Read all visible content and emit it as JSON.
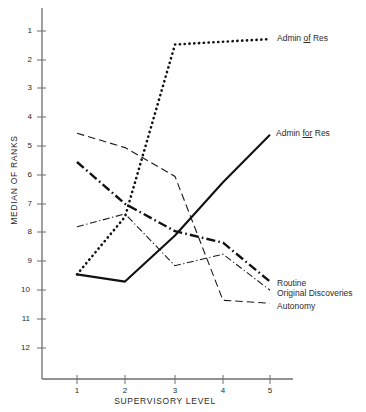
{
  "chart_data": {
    "type": "line",
    "title": "",
    "xlabel": "SUPERVISORY LEVEL",
    "ylabel": "MEDIAN OF RANKS",
    "x": [
      1,
      2,
      3,
      4,
      5
    ],
    "xticklabels": [
      "1",
      "2",
      "3",
      "4",
      "5"
    ],
    "yticklabels": [
      "1",
      "2",
      "3",
      "4",
      "5",
      "6",
      "7",
      "8",
      "9",
      "10",
      "11",
      "12"
    ],
    "yticks": [
      1,
      2,
      3,
      4,
      5,
      6,
      7,
      8,
      9,
      10,
      11,
      12
    ],
    "ylim": [
      12.5,
      0.5
    ],
    "y_inverted": true,
    "grid": false,
    "legend": "inline-right-labels",
    "series": [
      {
        "name": "Admin of Res",
        "label_html": "Admin <u>of</u> Res",
        "style": "dotted",
        "values": [
          9.45,
          7.45,
          1.47,
          1.37,
          1.28
        ]
      },
      {
        "name": "Admin for Res",
        "label_html": "Admin <u>for</u> Res",
        "style": "solid",
        "values": [
          9.45,
          9.7,
          8.1,
          6.25,
          4.6
        ]
      },
      {
        "name": "Routine",
        "label_html": "Routine",
        "style": "bold-dash-dot",
        "values": [
          5.55,
          7.0,
          7.95,
          8.35,
          9.7
        ]
      },
      {
        "name": "Original Discoveries",
        "label_html": "Original Discoveries",
        "style": "thin-dash-dot",
        "values": [
          7.8,
          7.35,
          9.15,
          8.75,
          10.0
        ]
      },
      {
        "name": "Autonomy",
        "label_html": "Autonomy",
        "style": "thin-long-dash",
        "values": [
          4.55,
          5.05,
          6.05,
          10.35,
          10.45
        ]
      }
    ]
  },
  "axes": {
    "y_title": "MEDIAN OF RANKS",
    "x_title": "SUPERVISORY LEVEL"
  },
  "labels": {
    "admin_of_res": "Admin of Res",
    "admin_for_res": "Admin for Res",
    "routine": "Routine",
    "original_discoveries": "Original Discoveries",
    "autonomy": "Autonomy"
  },
  "colors": {
    "ink": "#1a1a1a",
    "axis": "#6e6e6e",
    "text": "#2b2b2b",
    "background": "#ffffff"
  }
}
